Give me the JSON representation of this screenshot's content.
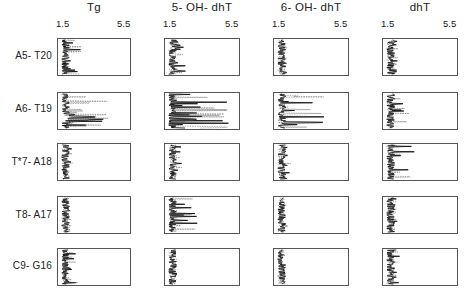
{
  "chart_data": {
    "type": "line",
    "layout": "small-multiples grid (5 rows x 4 columns)",
    "title": "",
    "columns": [
      "Tg",
      "5-OH-dhT",
      "6-OH-dhT",
      "dhT"
    ],
    "rows": [
      "A5-T20",
      "A6-T19",
      "T*7-A18",
      "T8-A17",
      "C9-G16"
    ],
    "x_axis": {
      "range": [
        1.5,
        5.5
      ],
      "tick_labels": [
        "1.5",
        "5.5"
      ],
      "orientation": "horizontal value axis, profile traced vertically"
    },
    "y_axis": {
      "label": "",
      "ticks_shown": false
    },
    "grid": false,
    "legend": null,
    "panels_description": "Each panel shows a noisy vertical profile hugging the low end (~1.5-2.5) of the 1.5-5.5 scale, with occasional spikes to the right. A6-T19 panels for Tg and 5-OH-dhT show larger excursions (up to ~4.5-5).",
    "approx_max_excursion": {
      "A5-T20": {
        "Tg": 2.8,
        "5-OH-dhT": 2.6,
        "6-OH-dhT": 2.2,
        "dhT": 2.3
      },
      "A6-T19": {
        "Tg": 4.5,
        "5-OH-dhT": 5.0,
        "6-OH-dhT": 4.3,
        "dhT": 3.3
      },
      "T*7-A18": {
        "Tg": 2.3,
        "5-OH-dhT": 2.4,
        "6-OH-dhT": 2.4,
        "dhT": 3.2
      },
      "T8-A17": {
        "Tg": 2.3,
        "5-OH-dhT": 3.3,
        "6-OH-dhT": 2.2,
        "dhT": 2.3
      },
      "C9-G16": {
        "Tg": 2.6,
        "5-OH-dhT": 2.0,
        "6-OH-dhT": 2.0,
        "dhT": 2.4
      }
    }
  },
  "columns": [
    {
      "title": "Tg",
      "tick_min": "1.5",
      "tick_max": "5.5"
    },
    {
      "title": "5- OH- dhT",
      "tick_min": "1.5",
      "tick_max": "5.5"
    },
    {
      "title": "6- OH- dhT",
      "tick_min": "1.5",
      "tick_max": "5.5"
    },
    {
      "title": "dhT",
      "tick_min": "1.5",
      "tick_max": "5.5"
    }
  ],
  "rows": [
    {
      "label": "A5- T20"
    },
    {
      "label": "A6- T19"
    },
    {
      "label": "T*7- A18"
    },
    {
      "label": "T8- A17"
    },
    {
      "label": "C9- G16"
    }
  ]
}
